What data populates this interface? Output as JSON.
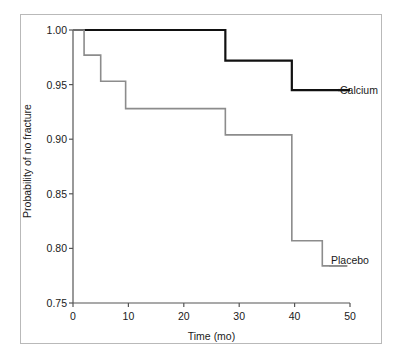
{
  "figure": {
    "background_color": "#ffffff",
    "frame_color": "#b9b9b9"
  },
  "axes": {
    "x": {
      "title": "Time (mo)",
      "ticks": [
        "0",
        "10",
        "20",
        "30",
        "40",
        "50"
      ],
      "min": 0,
      "max": 50
    },
    "y": {
      "title": "Probability of no fracture",
      "ticks": [
        "1.00",
        "0.95",
        "0.90",
        "0.85",
        "0.80",
        "0.75"
      ],
      "min": 0.75,
      "max": 1.0
    }
  },
  "series_labels": {
    "calcium": "Calcium",
    "placebo": "Placebo"
  },
  "chart_data": {
    "type": "line",
    "subtype": "kaplan-meier-step",
    "title": "",
    "xlabel": "Time (mo)",
    "ylabel": "Probability of no fracture",
    "xlim": [
      0,
      50
    ],
    "ylim": [
      0.75,
      1.0
    ],
    "xticks": [
      0,
      10,
      20,
      30,
      40,
      50
    ],
    "yticks": [
      0.75,
      0.8,
      0.85,
      0.9,
      0.95,
      1.0
    ],
    "grid": false,
    "legend": "inline-right-of-curve",
    "series": [
      {
        "name": "Calcium",
        "color": "#111111",
        "line_width": 2.2,
        "steps": [
          {
            "x": 0.0,
            "y": 1.0
          },
          {
            "x": 27.5,
            "y": 1.0
          },
          {
            "x": 27.5,
            "y": 0.972
          },
          {
            "x": 39.5,
            "y": 0.972
          },
          {
            "x": 39.5,
            "y": 0.945
          },
          {
            "x": 50.0,
            "y": 0.945
          }
        ]
      },
      {
        "name": "Placebo",
        "color": "#8c8c8c",
        "line_width": 1.6,
        "steps": [
          {
            "x": 0.0,
            "y": 1.0
          },
          {
            "x": 2.0,
            "y": 1.0
          },
          {
            "x": 2.0,
            "y": 0.977
          },
          {
            "x": 5.0,
            "y": 0.977
          },
          {
            "x": 5.0,
            "y": 0.953
          },
          {
            "x": 9.5,
            "y": 0.953
          },
          {
            "x": 9.5,
            "y": 0.928
          },
          {
            "x": 27.5,
            "y": 0.928
          },
          {
            "x": 27.5,
            "y": 0.904
          },
          {
            "x": 39.5,
            "y": 0.904
          },
          {
            "x": 39.5,
            "y": 0.807
          },
          {
            "x": 45.0,
            "y": 0.807
          },
          {
            "x": 45.0,
            "y": 0.784
          },
          {
            "x": 49.5,
            "y": 0.784
          }
        ]
      }
    ]
  }
}
